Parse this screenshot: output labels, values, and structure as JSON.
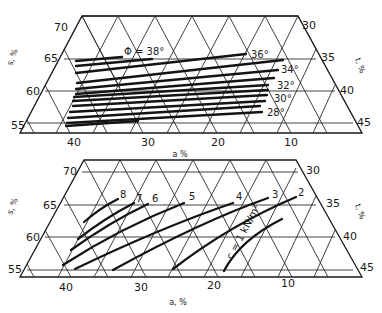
{
  "figure": {
    "top_diagram": {
      "title_label": "Φ = 38°",
      "left_axis": {
        "label": "s, %",
        "ticks": [
          "70",
          "65",
          "60",
          "55"
        ]
      },
      "right_axis": {
        "label": "t, %",
        "ticks": [
          "30",
          "35",
          "40",
          "45"
        ]
      },
      "bottom_axis": {
        "label": "a %",
        "ticks": [
          "40",
          "30",
          "20",
          "10"
        ]
      },
      "contour_labels": [
        "36°",
        "34°",
        "32°",
        "30°",
        "28°"
      ],
      "contour_variable": "Φ (friction angle)"
    },
    "bottom_diagram": {
      "left_axis": {
        "label": "s, %",
        "ticks": [
          "70",
          "65",
          "60",
          "55"
        ]
      },
      "right_axis": {
        "label": "t, %",
        "ticks": [
          "30",
          "35",
          "40",
          "45"
        ]
      },
      "bottom_axis": {
        "label": "a, %",
        "ticks": [
          "40",
          "30",
          "20",
          "10"
        ]
      },
      "contour_labels": [
        "8",
        "7",
        "6",
        "5",
        "4",
        "3",
        "2"
      ],
      "unit_label": "c = 1 kN/m²",
      "contour_variable": "c (cohesion, kN/m²)"
    }
  }
}
